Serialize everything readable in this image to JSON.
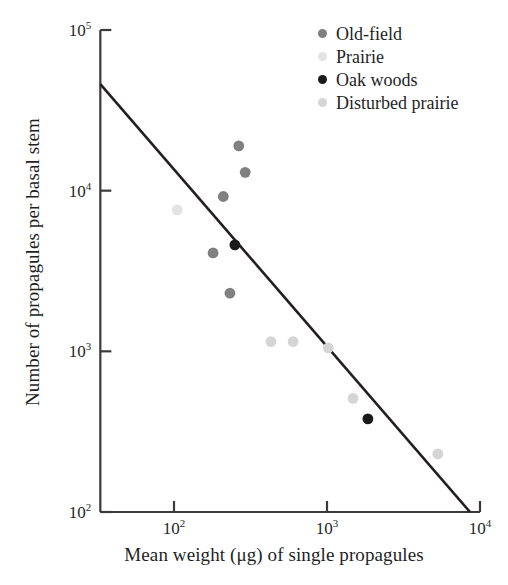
{
  "chart_data": {
    "type": "scatter",
    "title": "",
    "xlabel": "Mean weight (μg) of single propagules",
    "ylabel": "Number of propagules per basal stem",
    "xscale": "log",
    "yscale": "log",
    "xlim": [
      33,
      10000
    ],
    "ylim": [
      100,
      100000
    ],
    "grid": false,
    "legend_position": "top-right",
    "xticks": [
      {
        "value": 100,
        "label": "10",
        "exponent": "2"
      },
      {
        "value": 1000,
        "label": "10",
        "exponent": "3"
      },
      {
        "value": 10000,
        "label": "10",
        "exponent": "4"
      }
    ],
    "yticks": [
      {
        "value": 100000,
        "label": "10",
        "exponent": "5"
      },
      {
        "value": 10000,
        "label": "10",
        "exponent": "4"
      },
      {
        "value": 1000,
        "label": "10",
        "exponent": "3"
      },
      {
        "value": 100,
        "label": "10",
        "exponent": "2"
      }
    ],
    "series": [
      {
        "name": "Old-field",
        "color": "#808080",
        "marker": "circle",
        "points": [
          {
            "x": 265,
            "y": 19000
          },
          {
            "x": 292,
            "y": 13000
          },
          {
            "x": 210,
            "y": 9200
          },
          {
            "x": 180,
            "y": 4100
          },
          {
            "x": 232,
            "y": 2300
          }
        ]
      },
      {
        "name": "Prairie",
        "color": "#e3e3e3",
        "marker": "circle",
        "points": [
          {
            "x": 105,
            "y": 7600
          }
        ]
      },
      {
        "name": "Oak woods",
        "color": "#1a1a1a",
        "marker": "circle",
        "points": [
          {
            "x": 250,
            "y": 4600
          },
          {
            "x": 1850,
            "y": 380
          }
        ]
      },
      {
        "name": "Disturbed prairie",
        "color": "#d5d5d5",
        "marker": "circle",
        "points": [
          {
            "x": 430,
            "y": 1150
          },
          {
            "x": 600,
            "y": 1150
          },
          {
            "x": 1020,
            "y": 1050
          },
          {
            "x": 1480,
            "y": 510
          },
          {
            "x": 5300,
            "y": 230
          }
        ]
      }
    ],
    "trendline": {
      "name": "regression-line",
      "color": "#231f1f",
      "x_start": 33,
      "y_start": 46000,
      "x_end": 8600,
      "y_end": 100
    },
    "axis_color": "#3a3a3a"
  },
  "legend": {
    "items": [
      {
        "label": "Old-field",
        "color": "#808080"
      },
      {
        "label": "Prairie",
        "color": "#e3e3e3"
      },
      {
        "label": "Oak woods",
        "color": "#1a1a1a"
      },
      {
        "label": "Disturbed prairie",
        "color": "#d5d5d5"
      }
    ]
  }
}
